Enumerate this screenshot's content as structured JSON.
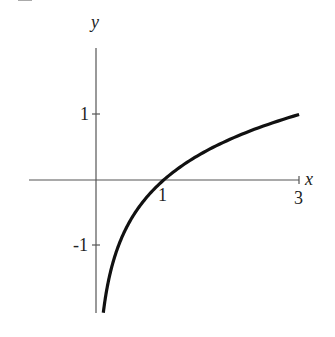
{
  "chart_data": {
    "type": "line",
    "title": "",
    "function": "y = log_3(x)",
    "xlabel": "x",
    "ylabel": "y",
    "x_ticks": [
      {
        "value": 1,
        "label": "1"
      },
      {
        "value": 3,
        "label": "3"
      }
    ],
    "y_ticks": [
      {
        "value": 1,
        "label": "1"
      },
      {
        "value": -1,
        "label": "-1"
      }
    ],
    "xlim": [
      -1,
      3
    ],
    "ylim": [
      -2,
      2.1
    ],
    "grid": false,
    "legend": null,
    "series": [
      {
        "name": "log3(x)",
        "x": [
          0.108,
          0.15,
          0.2,
          0.333,
          0.5,
          0.75,
          1,
          1.5,
          2,
          2.5,
          3
        ],
        "y": [
          -2.03,
          -1.73,
          -1.46,
          -1.0,
          -0.63,
          -0.26,
          0,
          0.37,
          0.63,
          0.83,
          1.0
        ]
      }
    ],
    "color": "#111111"
  },
  "labels": {
    "x_axis": "x",
    "y_axis": "y",
    "x_tick_1": "1",
    "x_tick_3": "3",
    "y_tick_pos1": "1",
    "y_tick_neg1": "-1"
  }
}
